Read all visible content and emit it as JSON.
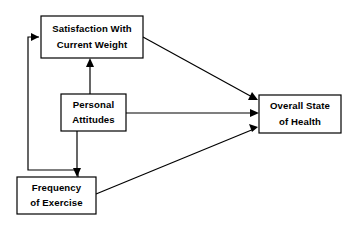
{
  "diagram": {
    "type": "path-model-diagram",
    "title": "",
    "background_color": "#ffffff",
    "line_color": "#000000",
    "box_fill_color": "#ffffff",
    "nodes": [
      {
        "id": "satisfaction",
        "name": "satisfaction-with-current-weight",
        "line1": "Satisfaction With",
        "line2": "Current Weight",
        "x": 41,
        "y": 16,
        "width": 102,
        "height": 42
      },
      {
        "id": "attitudes",
        "name": "personal-attitudes",
        "line1": "Personal",
        "line2": "Attitudes",
        "x": 61,
        "y": 94,
        "width": 65,
        "height": 37
      },
      {
        "id": "exercise",
        "name": "frequency-of-exercise",
        "line1": "Frequency",
        "line2": "of Exercise",
        "x": 17,
        "y": 177,
        "width": 79,
        "height": 37
      },
      {
        "id": "health",
        "name": "overall-state-of-health",
        "line1": "Overall State",
        "line2": "of Health",
        "x": 259,
        "y": 95,
        "width": 82,
        "height": 38
      }
    ],
    "edges": [
      {
        "id": "edge-exercise-to-satisfaction",
        "name": "arrow-exercise-to-satisfaction",
        "from": "exercise",
        "to": "satisfaction",
        "shape": "elbow",
        "points": "78,177 78,170 28,170 28,37 39,37",
        "head": "39,37 31,33 31,41",
        "head_direction": "right"
      },
      {
        "id": "edge-attitudes-to-satisfaction",
        "name": "arrow-attitudes-to-satisfaction",
        "from": "attitudes",
        "to": "satisfaction",
        "shape": "straight-vertical",
        "points": "90,94 90,61",
        "head": "90,58 86,67 94,67",
        "head_direction": "up"
      },
      {
        "id": "edge-attitudes-to-exercise",
        "name": "arrow-attitudes-to-exercise",
        "from": "attitudes",
        "to": "exercise",
        "shape": "straight-vertical",
        "points": "77,131 77,173",
        "head": "77,177 73,168 81,168",
        "head_direction": "down"
      },
      {
        "id": "edge-satisfaction-to-health",
        "name": "arrow-satisfaction-to-health",
        "from": "satisfaction",
        "to": "health",
        "shape": "diagonal",
        "points": "143,37 254,98",
        "head": "258,100 248,100 252,92",
        "head_direction": "down-right"
      },
      {
        "id": "edge-attitudes-to-health",
        "name": "arrow-attitudes-to-health",
        "from": "attitudes",
        "to": "health",
        "shape": "straight-horizontal",
        "points": "126,113 255,113",
        "head": "259,113 250,109 250,117",
        "head_direction": "right"
      },
      {
        "id": "edge-exercise-to-health",
        "name": "arrow-exercise-to-health",
        "from": "exercise",
        "to": "health",
        "shape": "diagonal",
        "points": "96,194 254,129",
        "head": "258,127 249,124 252,132",
        "head_direction": "up-right"
      }
    ]
  }
}
